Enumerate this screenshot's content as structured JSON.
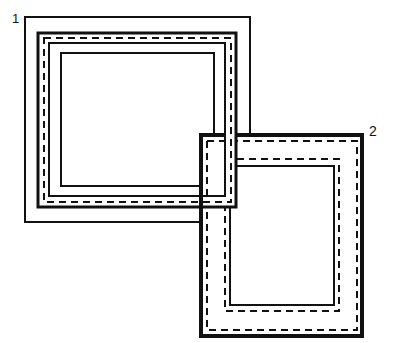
{
  "diagram": {
    "type": "overlapping-picture-frames",
    "labels": {
      "frame1": "1",
      "frame2": "2"
    },
    "colors": {
      "stroke": "#111111",
      "background": "#ffffff",
      "fill": "#ffffff"
    },
    "frames": [
      {
        "id": "frame1",
        "label": "1",
        "outer": {
          "x": 25,
          "y": 17,
          "w": 225,
          "h": 205,
          "stroke": 2
        },
        "border": {
          "x": 38,
          "y": 33,
          "w": 198,
          "h": 174,
          "stroke": 3
        },
        "dashed": {
          "x": 44,
          "y": 38,
          "w": 187,
          "h": 164,
          "stroke": 2
        },
        "inner_solid": {
          "x": 49,
          "y": 43,
          "w": 176,
          "h": 153,
          "stroke": 2
        },
        "opening": {
          "x": 61,
          "y": 53,
          "w": 153,
          "h": 133,
          "stroke": 2
        }
      },
      {
        "id": "frame2",
        "label": "2",
        "outer": {
          "x": 201,
          "y": 135,
          "w": 161,
          "h": 201,
          "stroke": 4
        },
        "outer_dashed": {
          "x": 207,
          "y": 141,
          "w": 150,
          "h": 189,
          "stroke": 2
        },
        "inner_dashed": {
          "x": 225,
          "y": 159,
          "w": 114,
          "h": 152,
          "stroke": 2
        },
        "opening": {
          "x": 230,
          "y": 166,
          "w": 104,
          "h": 139,
          "stroke": 2
        }
      }
    ]
  }
}
